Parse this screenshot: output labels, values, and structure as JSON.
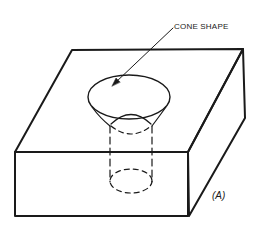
{
  "diagram": {
    "labels": {
      "cone": "CONE SHAPE",
      "figure": "(A)"
    },
    "colors": {
      "line": "#1a1a1a",
      "background": "#ffffff"
    }
  }
}
